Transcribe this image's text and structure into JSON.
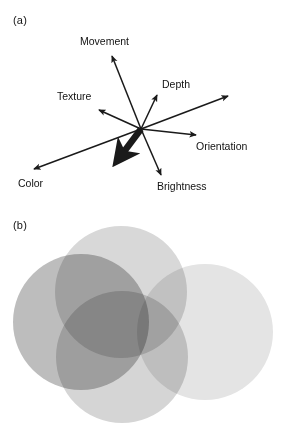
{
  "figure": {
    "width": 281,
    "height": 434,
    "background": "#ffffff"
  },
  "panel_a": {
    "label": "(a)",
    "description": "radial vector diagram of visual feature dimensions",
    "origin": {
      "x": 141,
      "y": 129
    },
    "stroke_color": "#1a1a1a",
    "vectors": [
      {
        "name": "movement",
        "label": "Movement",
        "tip": {
          "x": 112,
          "y": 56
        },
        "label_pos": {
          "x": 80,
          "y": 36
        },
        "thick": false
      },
      {
        "name": "depth",
        "label": "Depth",
        "tip": {
          "x": 157,
          "y": 95
        },
        "label_pos": {
          "x": 162,
          "y": 79
        },
        "thick": false
      },
      {
        "name": "texture",
        "label": "Texture",
        "tip": {
          "x": 99,
          "y": 110
        },
        "label_pos": {
          "x": 57,
          "y": 91
        },
        "thick": false
      },
      {
        "name": "orientation",
        "label": "Orientation",
        "tip": {
          "x": 196,
          "y": 135
        },
        "label_pos": {
          "x": 196,
          "y": 141
        },
        "thick": false
      },
      {
        "name": "brightness",
        "label": "Brightness",
        "tip": {
          "x": 161,
          "y": 175
        },
        "label_pos": {
          "x": 157,
          "y": 181
        },
        "thick": false
      },
      {
        "name": "color",
        "label": "Color",
        "tip": {
          "x": 34,
          "y": 169
        },
        "label_pos": {
          "x": 18,
          "y": 178
        },
        "thick": false
      },
      {
        "name": "unlabeled-upper-right",
        "label": "",
        "tip": {
          "x": 228,
          "y": 96
        },
        "label_pos": null,
        "thick": false
      },
      {
        "name": "resultant-thick",
        "label": "",
        "tip": {
          "x": 117,
          "y": 161
        },
        "label_pos": null,
        "thick": true
      }
    ]
  },
  "panel_b": {
    "label": "(b)",
    "description": "four overlapping translucent gray circles",
    "circles": [
      {
        "name": "circle-top",
        "cx": 121,
        "cy": 80,
        "r": 66,
        "fill": "#d8d8d8"
      },
      {
        "name": "circle-left",
        "cx": 81,
        "cy": 110,
        "r": 68,
        "fill": "#bdbdbd"
      },
      {
        "name": "circle-bottom",
        "cx": 122,
        "cy": 145,
        "r": 66,
        "fill": "#d5d5d5"
      },
      {
        "name": "circle-right",
        "cx": 205,
        "cy": 120,
        "r": 68,
        "fill": "#e4e4e4"
      }
    ],
    "blend_mode": "multiply"
  }
}
